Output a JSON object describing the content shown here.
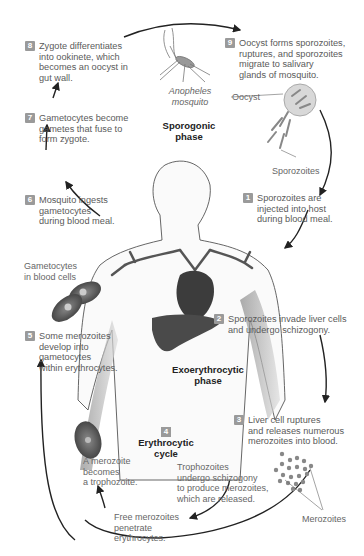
{
  "phases": {
    "sporogonic": [
      "Sporogonic",
      "phase"
    ],
    "exoerythrocytic": [
      "Exoerythrocytic",
      "phase"
    ],
    "erythrocytic": [
      "Erythrocytic",
      "cycle"
    ]
  },
  "steps": [
    {
      "num": "1",
      "lines": [
        "Sporozoites are",
        "injected into host",
        "during blood meal."
      ]
    },
    {
      "num": "2",
      "lines": [
        "Sporozoites invade liver cells",
        "and undergo schizogony."
      ]
    },
    {
      "num": "3",
      "lines": [
        "Liver cell ruptures",
        "and releases numerous",
        "merozoites into blood."
      ]
    },
    {
      "num": "4",
      "lines": []
    },
    {
      "num": "5",
      "lines": [
        "Some merozoites",
        "develop into",
        "gametocytes",
        "within erythrocytes."
      ]
    },
    {
      "num": "6",
      "lines": [
        "Mosquito ingests",
        "gametocytes",
        "during blood meal."
      ]
    },
    {
      "num": "7",
      "lines": [
        "Gametocytes become",
        "gametes that fuse to",
        "form zygote."
      ]
    },
    {
      "num": "8",
      "lines": [
        "Zygote differentiates",
        "into ookinete, which",
        "becomes an oocyst in",
        "gut wall."
      ]
    },
    {
      "num": "9",
      "lines": [
        "Oocyst forms sporozoites,",
        "ruptures, and sporozoites",
        "migrate to salivary",
        "glands of mosquito."
      ]
    }
  ],
  "labels": {
    "mosquito": [
      "Anopheles",
      "mosquito"
    ],
    "oocyst": "Oocyst",
    "sporozoites": "Sporozoites",
    "gametocytes_in_blood": [
      "Gametocytes",
      "in blood cells"
    ],
    "merozoites": "Merozoites",
    "trophozoite_note": [
      "A merozoite",
      "becomes",
      "a trophozoite."
    ],
    "schizogony_note": [
      "Trophozoites",
      "undergo schizogony",
      "to produce merozoites,",
      "which are released."
    ],
    "free_merozoites": [
      "Free merozoites",
      "penetrate",
      "erythrocytes."
    ]
  },
  "colors": {
    "badge": "#9a9a9a",
    "organ": "#4a4a4a",
    "arrow": "#222222",
    "text": "#5a5a5a"
  }
}
